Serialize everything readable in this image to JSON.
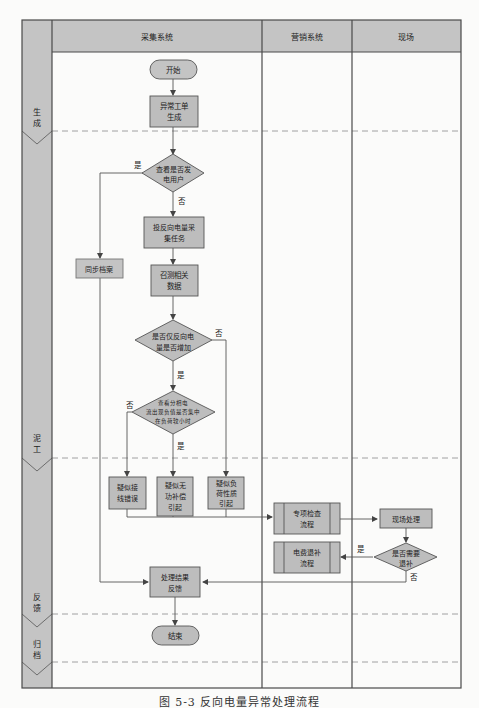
{
  "colors": {
    "frame": "#4a4a4a",
    "header_fill": "#c4c4c4",
    "phase_fill": "#c4c4c4",
    "node_fill": "#bdbdbd",
    "line": "#555555",
    "dash": "#888888",
    "background": "#fbfbfa"
  },
  "lanes": [
    {
      "label": "采集系统"
    },
    {
      "label": "营销系统"
    },
    {
      "label": "现场"
    }
  ],
  "phases": [
    {
      "label_top": "生",
      "label_bottom": "成"
    },
    {
      "label_top": "泥",
      "label_bottom": "工"
    },
    {
      "label_top": "反",
      "label_bottom": "馈"
    },
    {
      "label_top": "归",
      "label_bottom": "档"
    }
  ],
  "nodes": {
    "start": {
      "lines": [
        "开始"
      ]
    },
    "generate": {
      "lines": [
        "异常工单",
        "生成"
      ]
    },
    "check_user": {
      "lines": [
        "查看是否发",
        "电用户"
      ]
    },
    "collect_task": {
      "lines": [
        "投反向电量采",
        "集任务"
      ]
    },
    "sync_archive": {
      "lines": [
        "同步档案"
      ]
    },
    "call_data": {
      "lines": [
        "召测相关",
        "数据"
      ]
    },
    "only_reverse": {
      "lines": [
        "是否仅反向电",
        "量是否增加"
      ]
    },
    "phase_current": {
      "lines": [
        "查看分相电",
        "流出现负值是否集中",
        "在负荷较小时"
      ]
    },
    "wiring_error": {
      "lines": [
        "疑似接",
        "线错误"
      ]
    },
    "reactive_comp": {
      "lines": [
        "疑似无",
        "功补偿",
        "引起"
      ]
    },
    "load_nature": {
      "lines": [
        "疑似负",
        "荷性质",
        "引起"
      ]
    },
    "special_check": {
      "lines": [
        "专项检查",
        "流程"
      ]
    },
    "onsite": {
      "lines": [
        "现场处理"
      ]
    },
    "need_refund": {
      "lines": [
        "是否需要",
        "退补"
      ]
    },
    "refund_flow": {
      "lines": [
        "电费退补",
        "流程"
      ]
    },
    "feedback": {
      "lines": [
        "处理结果",
        "反馈"
      ]
    },
    "end": {
      "lines": [
        "结束"
      ]
    }
  },
  "edge_labels": {
    "check_user_yes": "是",
    "check_user_no": "否",
    "only_reverse_no": "否",
    "only_reverse_yes": "是",
    "phase_current_no": "否",
    "phase_current_yes": "是",
    "need_refund_yes": "是",
    "need_refund_no": "否"
  },
  "caption": "图 5-3  反向电量异常处理流程"
}
